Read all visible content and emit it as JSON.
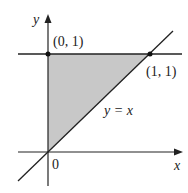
{
  "diagram": {
    "type": "region-plot",
    "axes": {
      "x_label": "x",
      "y_label": "y",
      "origin_label": "0"
    },
    "lines": [
      {
        "name": "y = 1 (horizontal)",
        "equation": "y = 1"
      },
      {
        "name": "diagonal",
        "equation": "y = x",
        "label": "y = x"
      }
    ],
    "points": [
      {
        "label": "(0, 1)",
        "x": 0,
        "y": 1
      },
      {
        "label": "(1, 1)",
        "x": 1,
        "y": 1
      }
    ],
    "shaded_region": {
      "vertices": [
        [
          0,
          0
        ],
        [
          0,
          1
        ],
        [
          1,
          1
        ]
      ],
      "color": "#c8c8c8"
    },
    "colors": {
      "line": "#222222",
      "shade": "#c8c8c8",
      "background": "#ffffff"
    }
  }
}
